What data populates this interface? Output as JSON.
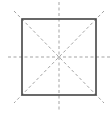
{
  "diagram": {
    "colors": {
      "background": "#ffffff",
      "square_stroke": "#444444",
      "symmetry_stroke": "#999999"
    },
    "square": {
      "x": 22,
      "y": 19,
      "width": 74,
      "height": 76,
      "stroke_width": 1.6
    },
    "symmetry_lines": [
      {
        "name": "vertical",
        "x1": 59,
        "y1": 2,
        "x2": 59,
        "y2": 111
      },
      {
        "name": "horizontal",
        "x1": 8,
        "y1": 57,
        "x2": 110,
        "y2": 57
      },
      {
        "name": "diagonal-main",
        "x1": 14,
        "y1": 11,
        "x2": 104,
        "y2": 103
      },
      {
        "name": "diagonal-anti",
        "x1": 104,
        "y1": 11,
        "x2": 14,
        "y2": 103
      }
    ],
    "line_count": 4
  }
}
